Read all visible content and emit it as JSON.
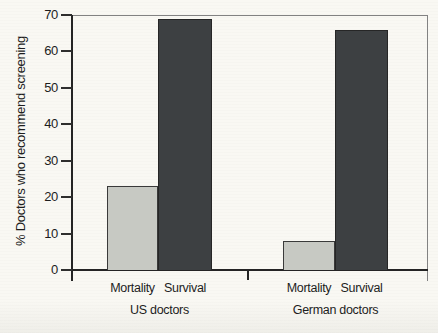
{
  "figure": {
    "background": "#f9f8f3",
    "text_color": "#1d1d1d",
    "frame_color": "#828282",
    "axis_color": "#242424"
  },
  "chart_data": {
    "type": "bar",
    "title": "",
    "xlabel": "",
    "ylabel": "% Doctors who recommend screening",
    "ylim": [
      0,
      70
    ],
    "yticks": [
      0,
      10,
      20,
      30,
      40,
      50,
      60,
      70
    ],
    "grid": false,
    "legend": "none",
    "categories": [
      "Mortality",
      "Survival"
    ],
    "groups": [
      {
        "label": "US doctors",
        "bars": [
          {
            "category": "Mortality",
            "value": 23
          },
          {
            "category": "Survival",
            "value": 69
          }
        ]
      },
      {
        "label": "German doctors",
        "bars": [
          {
            "category": "Mortality",
            "value": 8
          },
          {
            "category": "Survival",
            "value": 66
          }
        ]
      }
    ],
    "bar_colors": {
      "Mortality": "#c7c9c3",
      "Survival": "#3d4042"
    },
    "bar_border_colors": {
      "Mortality": "#3a3a3a",
      "Survival": "#262626"
    }
  }
}
